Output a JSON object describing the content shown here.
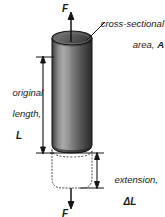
{
  "figure": {
    "type": "physics-diagram",
    "background_color": "#ffffff",
    "width": 165,
    "height": 217
  },
  "labels": {
    "force_top": "F",
    "force_bottom": "F",
    "cross_section_line1": "cross-sectional",
    "cross_section_line2": "area, ",
    "cross_section_symbol": "A",
    "original_length_line1": "original",
    "original_length_line2": "length,",
    "original_length_symbol": "L",
    "extension_line1": "extension,",
    "extension_symbol": "ΔL"
  },
  "colors": {
    "ink": "#1a1a1a",
    "line": "#141414",
    "cylinder_top_fill": "#5a5a5a",
    "cylinder_top_edge": "#2a2a2a",
    "cylinder_dark": "#2b2b2b",
    "cylinder_mid": "#8e8e8e",
    "cylinder_light": "#b5b5b5",
    "cylinder_shadow": "#1e1e1e",
    "dotted": "#555555"
  },
  "geometry": {
    "cylinder_left_x": 52,
    "cylinder_right_x": 92,
    "cylinder_top_y": 38,
    "cylinder_bottom_y": 152,
    "ellipse_ry": 7,
    "extension_bottom_y": 188,
    "dim_left_x": 43,
    "dim_right_x": 97,
    "arrow_axis_x": 71
  },
  "elements": {
    "arrow_up_name": "force-arrow-up",
    "arrow_down_name": "force-arrow-down",
    "dimension_length_name": "original-length-dimension-line",
    "dimension_extension_name": "extension-dimension-line",
    "leader_name": "cross-section-leader-line",
    "cylinder_name": "cylinder-body",
    "extension_outline_name": "extension-dotted-outline"
  }
}
